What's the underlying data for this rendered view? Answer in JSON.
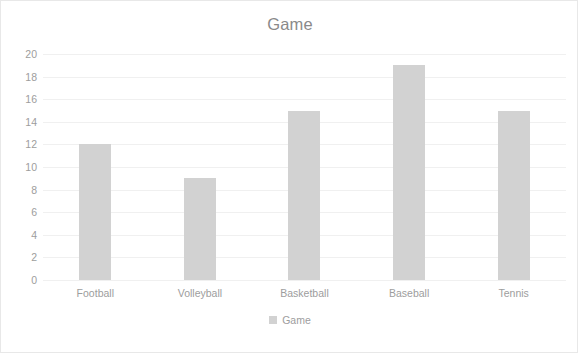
{
  "chart_data": {
    "type": "bar",
    "title": "Game",
    "xlabel": "",
    "ylabel": "",
    "categories": [
      "Football",
      "Volleyball",
      "Basketball",
      "Baseball",
      "Tennis"
    ],
    "values": [
      12,
      9,
      15,
      19,
      15
    ],
    "series": [
      {
        "name": "Game",
        "values": [
          12,
          9,
          15,
          19,
          15
        ]
      }
    ],
    "ylim": [
      0,
      20
    ],
    "ytick_step": 2,
    "yticks": [
      20,
      18,
      16,
      14,
      12,
      10,
      8,
      6,
      4,
      2,
      0
    ],
    "grid": true,
    "legend": [
      "Game"
    ],
    "legend_position": "bottom",
    "bar_color": "#d2d2d2",
    "gridline_color": "#f0f0f0",
    "text_color": "#9d9d9d",
    "border_color": "#e8e8e8"
  }
}
